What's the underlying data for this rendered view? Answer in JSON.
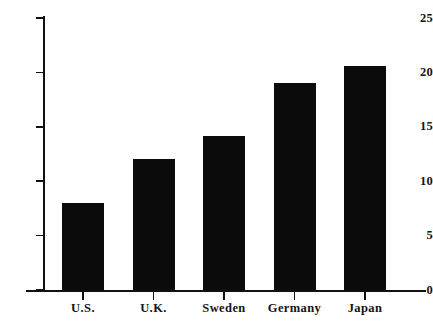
{
  "chart_data": {
    "type": "bar",
    "title": "",
    "subtitle": "",
    "xlabel": "",
    "ylabel": "",
    "categories": [
      "U.S.",
      "U.K.",
      "Sweden",
      "Germany",
      "Japan"
    ],
    "values": [
      8.0,
      12.0,
      14.2,
      19.0,
      20.6
    ],
    "series": [
      {
        "name": "",
        "values": [
          8.0,
          12.0,
          14.2,
          19.0,
          20.6
        ]
      }
    ],
    "ylim": [
      0,
      25
    ],
    "yticks": [
      0,
      5,
      10,
      15,
      20,
      25
    ],
    "ytick_labels": [
      "0",
      "5",
      "10",
      "15",
      "20",
      "25"
    ],
    "xtick_labels": [
      "U.S.",
      "U.K.",
      "Sweden",
      "Germany",
      "Japan"
    ],
    "grid": false,
    "legend": null,
    "legend_position": "none",
    "annotations": [],
    "bar_color": "#0b0b0b",
    "axis_color": "#111111",
    "background_color": "#ffffff"
  }
}
